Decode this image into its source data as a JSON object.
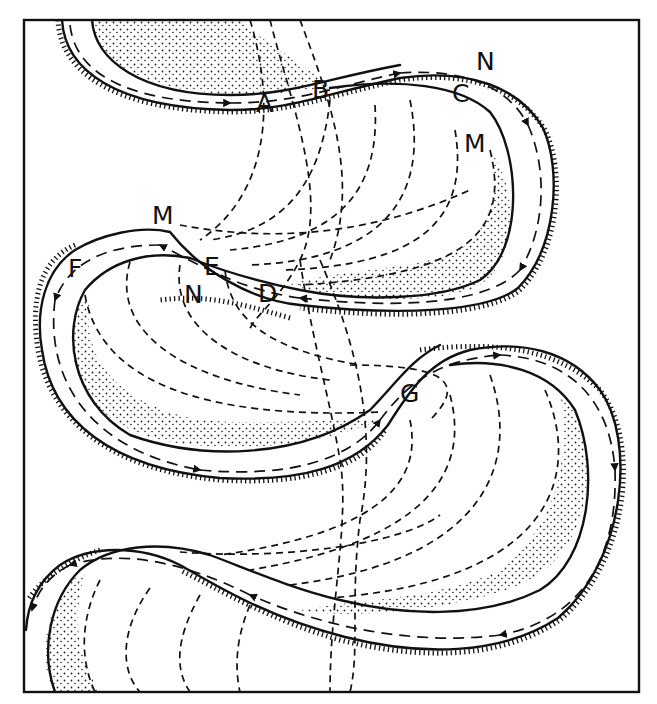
{
  "diagram": {
    "type": "meandering river channel diagram",
    "frame": {
      "x": 24,
      "y": 20,
      "width": 615,
      "height": 672
    },
    "colors": {
      "ink": "#111111",
      "background": "#ffffff",
      "stipple": "#222222"
    },
    "legend_notes": {
      "solid_lines": "river banks",
      "hachured_bank": "cut bank (eroding outer bend)",
      "stippled_area": "point bar deposits (inner bend)",
      "dashed_arrows": "current / flow direction",
      "dashed_curves": "older meander scroll positions"
    },
    "labels": [
      {
        "id": "label-A",
        "text": "A",
        "x": 256,
        "y": 112
      },
      {
        "id": "label-B",
        "text": "B",
        "x": 312,
        "y": 98
      },
      {
        "id": "label-C",
        "text": "C",
        "x": 452,
        "y": 102
      },
      {
        "id": "label-N-top",
        "text": "N",
        "x": 476,
        "y": 70
      },
      {
        "id": "label-M-top",
        "text": "M",
        "x": 464,
        "y": 152
      },
      {
        "id": "label-M-mid",
        "text": "M",
        "x": 152,
        "y": 224
      },
      {
        "id": "label-F",
        "text": "F",
        "x": 68,
        "y": 277
      },
      {
        "id": "label-E",
        "text": "E",
        "x": 204,
        "y": 275
      },
      {
        "id": "label-N-mid",
        "text": "N",
        "x": 184,
        "y": 303
      },
      {
        "id": "label-D",
        "text": "D",
        "x": 258,
        "y": 302
      },
      {
        "id": "label-G",
        "text": "G",
        "x": 400,
        "y": 402
      }
    ]
  }
}
